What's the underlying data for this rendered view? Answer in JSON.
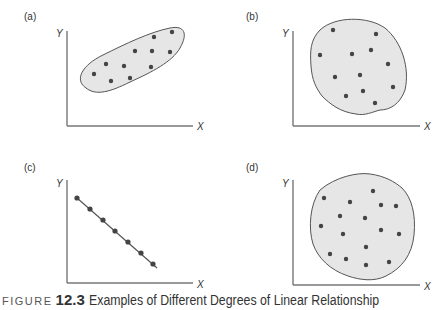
{
  "chart_data": [
    {
      "type": "scatter",
      "panel": "(a)",
      "xlabel": "X",
      "ylabel": "Y",
      "description": "Strong positive linear relationship; points enclosed in elongated ellipse",
      "points": [
        [
          94,
          74
        ],
        [
          106,
          64
        ],
        [
          111,
          81
        ],
        [
          124,
          66
        ],
        [
          130,
          78
        ],
        [
          135,
          51
        ],
        [
          151,
          67
        ],
        [
          152,
          51
        ],
        [
          154,
          37
        ],
        [
          170,
          52
        ],
        [
          172,
          32
        ]
      ]
    },
    {
      "type": "scatter",
      "panel": "(b)",
      "xlabel": "X",
      "ylabel": "Y",
      "description": "Weak negative relationship; points enclosed in oval",
      "points": [
        [
          333,
          30
        ],
        [
          376,
          34
        ],
        [
          320,
          55
        ],
        [
          352,
          54
        ],
        [
          371,
          50
        ],
        [
          388,
          64
        ],
        [
          335,
          77
        ],
        [
          360,
          75
        ],
        [
          393,
          87
        ],
        [
          346,
          96
        ],
        [
          363,
          91
        ],
        [
          375,
          103
        ]
      ]
    },
    {
      "type": "scatter",
      "panel": "(c)",
      "xlabel": "X",
      "ylabel": "Y",
      "description": "Perfect negative linear relationship; points on a straight line",
      "points": [
        [
          77,
          198
        ],
        [
          90,
          209
        ],
        [
          103,
          220
        ],
        [
          115,
          231
        ],
        [
          128,
          242
        ],
        [
          141,
          253
        ],
        [
          153,
          264
        ]
      ]
    },
    {
      "type": "scatter",
      "panel": "(d)",
      "xlabel": "X",
      "ylabel": "Y",
      "description": "No linear relationship; points enclosed in circle",
      "points": [
        [
          373,
          191
        ],
        [
          324,
          198
        ],
        [
          350,
          202
        ],
        [
          381,
          205
        ],
        [
          396,
          206
        ],
        [
          340,
          216
        ],
        [
          365,
          218
        ],
        [
          321,
          226
        ],
        [
          343,
          234
        ],
        [
          381,
          230
        ],
        [
          399,
          234
        ],
        [
          366,
          247
        ],
        [
          330,
          254
        ],
        [
          346,
          259
        ],
        [
          366,
          265
        ],
        [
          389,
          262
        ]
      ]
    }
  ],
  "panels": {
    "a": {
      "label": "(a)",
      "x_axis": "X",
      "y_axis": "Y"
    },
    "b": {
      "label": "(b)",
      "x_axis": "X",
      "y_axis": "Y"
    },
    "c": {
      "label": "(c)",
      "x_axis": "X",
      "y_axis": "Y"
    },
    "d": {
      "label": "(d)",
      "x_axis": "X",
      "y_axis": "Y"
    }
  },
  "caption": {
    "prefix": "FIGURE",
    "number": "12.3",
    "text": "Examples of Different Degrees of Linear Relationship"
  },
  "colors": {
    "axis": "#777777",
    "point": "#444444",
    "region_fill": "#e6e6e6",
    "region_stroke": "#555555"
  }
}
